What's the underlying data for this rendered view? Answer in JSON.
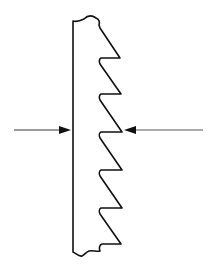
{
  "diagram": {
    "colors": {
      "background": "#ffffff",
      "stroke": "#111111",
      "arrow": "#222222"
    },
    "strip": {
      "label": "",
      "teeth_count": 6
    },
    "arrows": [
      {
        "name": "left-force-arrow",
        "direction": "right",
        "label": ""
      },
      {
        "name": "right-force-arrow",
        "direction": "left",
        "label": ""
      }
    ]
  }
}
